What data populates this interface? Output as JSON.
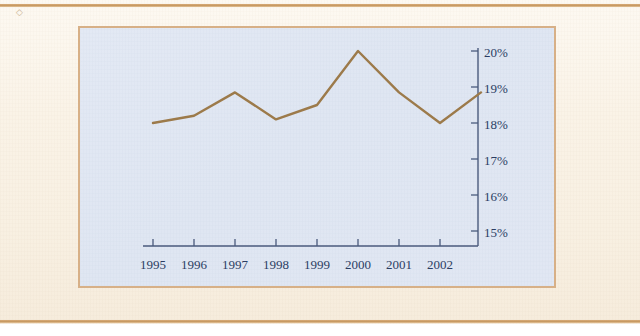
{
  "page": {
    "background_color": "#faf3e7",
    "rule_color": "#c79a63",
    "panel_background_color": "#e0e7f3",
    "panel_border_color": "#d7b087"
  },
  "chart_panel": {
    "name": "line-chart-panel",
    "axis_color": "#4a5a7c",
    "line_color": "#9c7a4a"
  },
  "chart_data": {
    "type": "line",
    "title": "",
    "subtitle": "",
    "xlabel": "",
    "ylabel": "",
    "grid": false,
    "legend": null,
    "y_axis_position": "right",
    "x": [
      1995,
      1996,
      1997,
      1998,
      1999,
      2000,
      2001,
      2002,
      2003
    ],
    "categories": [
      "1995",
      "1996",
      "1997",
      "1998",
      "1999",
      "2000",
      "2001",
      "2002",
      "2003"
    ],
    "x_tick_labels": [
      "1995",
      "1996",
      "1997",
      "1998",
      "1999",
      "2000",
      "2001",
      "2002"
    ],
    "values": [
      18.0,
      18.2,
      18.85,
      18.1,
      18.5,
      20.0,
      18.85,
      18.0,
      18.85
    ],
    "y_tick_labels": [
      "20%",
      "19%",
      "18%",
      "17%",
      "16%",
      "15%"
    ],
    "y_tick_values": [
      20,
      19,
      18,
      17,
      16,
      15
    ],
    "ylim": [
      14.3,
      20.3
    ],
    "xlim": [
      1994.6,
      2003.2
    ]
  }
}
